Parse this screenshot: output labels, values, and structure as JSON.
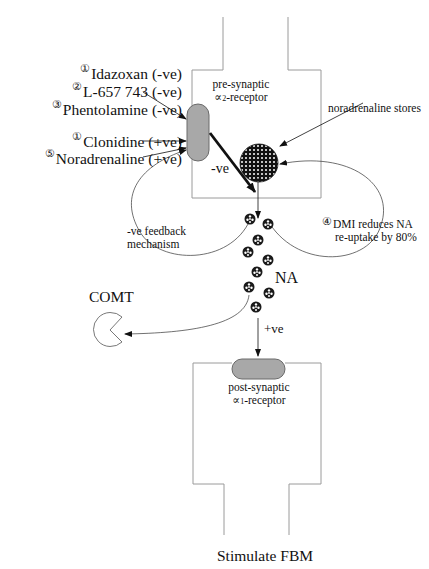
{
  "header": {
    "text": ""
  },
  "presynaptic": {
    "receptor_label_line1": "pre-synaptic",
    "receptor_label_line2": "α2-receptor",
    "alpha_symbol": "∝",
    "receptor_subscript": "2",
    "receptor_suffix": "-receptor",
    "stores_label": "noradrenaline stores",
    "neg_arrow_label": "-ve"
  },
  "drugs": [
    {
      "number": "①",
      "name": "Idazoxan (-ve)"
    },
    {
      "number": "②",
      "name": "L-657 743 (-ve)"
    },
    {
      "number": "③",
      "name": "Phentolamine (-ve)"
    },
    {
      "number": "①",
      "name": "Clonidine (+ve)"
    },
    {
      "number": "⑤",
      "name": "Noradrenaline (+ve)"
    }
  ],
  "feedback": {
    "line1": "-ve feedback",
    "line2": "mechanism"
  },
  "reuptake": {
    "number": "④",
    "line1": "DMI reduces NA",
    "line2": "re-uptake by 80%"
  },
  "synapse": {
    "na_label": "NA",
    "pos_arrow_label": "+ve",
    "comt_label": "COMT"
  },
  "postsynaptic": {
    "receptor_label_line1": "post-synaptic",
    "alpha_symbol": "∝",
    "receptor_subscript": "1",
    "receptor_suffix": "-receptor"
  },
  "footer": {
    "label": "Stimulate FBM"
  },
  "colors": {
    "outline": "#9a9a9a",
    "receptor_fill": "#a8a8a8",
    "receptor_stroke": "#6a6a6a",
    "ink": "#111111"
  }
}
